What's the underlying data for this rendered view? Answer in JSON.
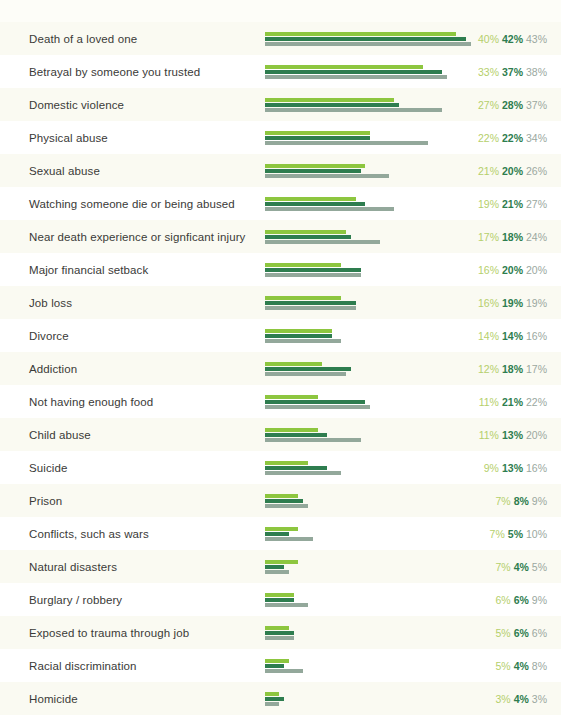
{
  "chart_data": {
    "type": "bar",
    "orientation": "horizontal",
    "title": "",
    "subtitle": "",
    "xlabel": "",
    "ylabel": "",
    "grid": false,
    "legend": "none",
    "value_suffix": "%",
    "xlim": [
      0,
      43
    ],
    "categories": [
      "Death of a loved one",
      "Betrayal by someone you trusted",
      "Domestic violence",
      "Physical abuse",
      "Sexual abuse",
      "Watching someone die or being abused",
      "Near death experience or signficant injury",
      "Major financial setback",
      "Job loss",
      "Divorce",
      "Addiction",
      "Not having enough food",
      "Child abuse",
      "Suicide",
      "Prison",
      "Conflicts, such as wars",
      "Natural disasters",
      "Burglary / robbery",
      "Exposed to trauma through job",
      "Racial discrimination",
      "Homicide"
    ],
    "series": [
      {
        "name": "series-1",
        "color": "#8dc63f",
        "values": [
          40,
          33,
          27,
          22,
          21,
          19,
          17,
          16,
          16,
          14,
          12,
          11,
          11,
          9,
          7,
          7,
          7,
          6,
          5,
          5,
          3
        ]
      },
      {
        "name": "series-2",
        "color": "#2e7d4f",
        "values": [
          42,
          37,
          28,
          22,
          20,
          21,
          18,
          20,
          19,
          14,
          18,
          21,
          13,
          13,
          8,
          5,
          4,
          6,
          6,
          4,
          4
        ]
      },
      {
        "name": "series-3",
        "color": "#93a89b",
        "values": [
          43,
          38,
          37,
          34,
          26,
          27,
          24,
          20,
          19,
          16,
          17,
          22,
          20,
          16,
          9,
          10,
          5,
          9,
          6,
          8,
          3
        ]
      }
    ],
    "label_colors": {
      "series_1": "#b5cf6b",
      "series_2": "#2e7d4f",
      "series_3": "#9aa8a0"
    },
    "value_labels": [
      [
        "40%",
        "42%",
        "43%"
      ],
      [
        "33%",
        "37%",
        "38%"
      ],
      [
        "27%",
        "28%",
        "37%"
      ],
      [
        "22%",
        "22%",
        "34%"
      ],
      [
        "21%",
        "20%",
        "26%"
      ],
      [
        "19%",
        "21%",
        "27%"
      ],
      [
        "17%",
        "18%",
        "24%"
      ],
      [
        "16%",
        "20%",
        "20%"
      ],
      [
        "16%",
        "19%",
        "19%"
      ],
      [
        "14%",
        "14%",
        "16%"
      ],
      [
        "12%",
        "18%",
        "17%"
      ],
      [
        "11%",
        "21%",
        "22%"
      ],
      [
        "11%",
        "13%",
        "20%"
      ],
      [
        "9%",
        "13%",
        "16%"
      ],
      [
        "7%",
        "8%",
        "9%"
      ],
      [
        "7%",
        "5%",
        "10%"
      ],
      [
        "7%",
        "4%",
        "5%"
      ],
      [
        "6%",
        "6%",
        "9%"
      ],
      [
        "5%",
        "6%",
        "6%"
      ],
      [
        "5%",
        "4%",
        "8%"
      ],
      [
        "3%",
        "4%",
        "3%"
      ]
    ]
  },
  "style": {
    "background": "#fdfdf8",
    "row_alt_background": "#fafaf2",
    "category_text_color": "#3a3a38",
    "px_per_percent": 4.78,
    "bar_start_x": 265
  }
}
